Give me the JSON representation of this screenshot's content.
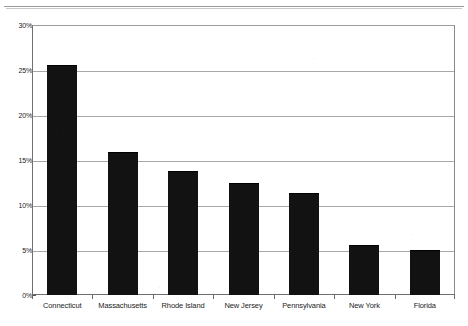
{
  "chart_data": {
    "type": "bar",
    "title": "",
    "subtitle": "",
    "xlabel": "",
    "ylabel": "",
    "categories": [
      "Connecticut",
      "Massachusetts",
      "Rhode Island",
      "New Jersey",
      "Pennsylvania",
      "New York",
      "Florida"
    ],
    "values": [
      25.5,
      15.9,
      13.8,
      12.4,
      11.3,
      5.5,
      5.0
    ],
    "value_suffix": "%",
    "ylim": [
      0,
      30
    ],
    "ytick_values": [
      0,
      5,
      10,
      15,
      20,
      25,
      30
    ],
    "ytick_labels": [
      "0%",
      "5%",
      "10%",
      "15%",
      "20%",
      "25%",
      "30%"
    ],
    "grid": true,
    "legend": false,
    "legend_position": "none",
    "bar_color": "#121212",
    "gridline_color": "#a8a8a8",
    "axis_color": "#6f6f6f",
    "background_color": "#ffffff"
  }
}
